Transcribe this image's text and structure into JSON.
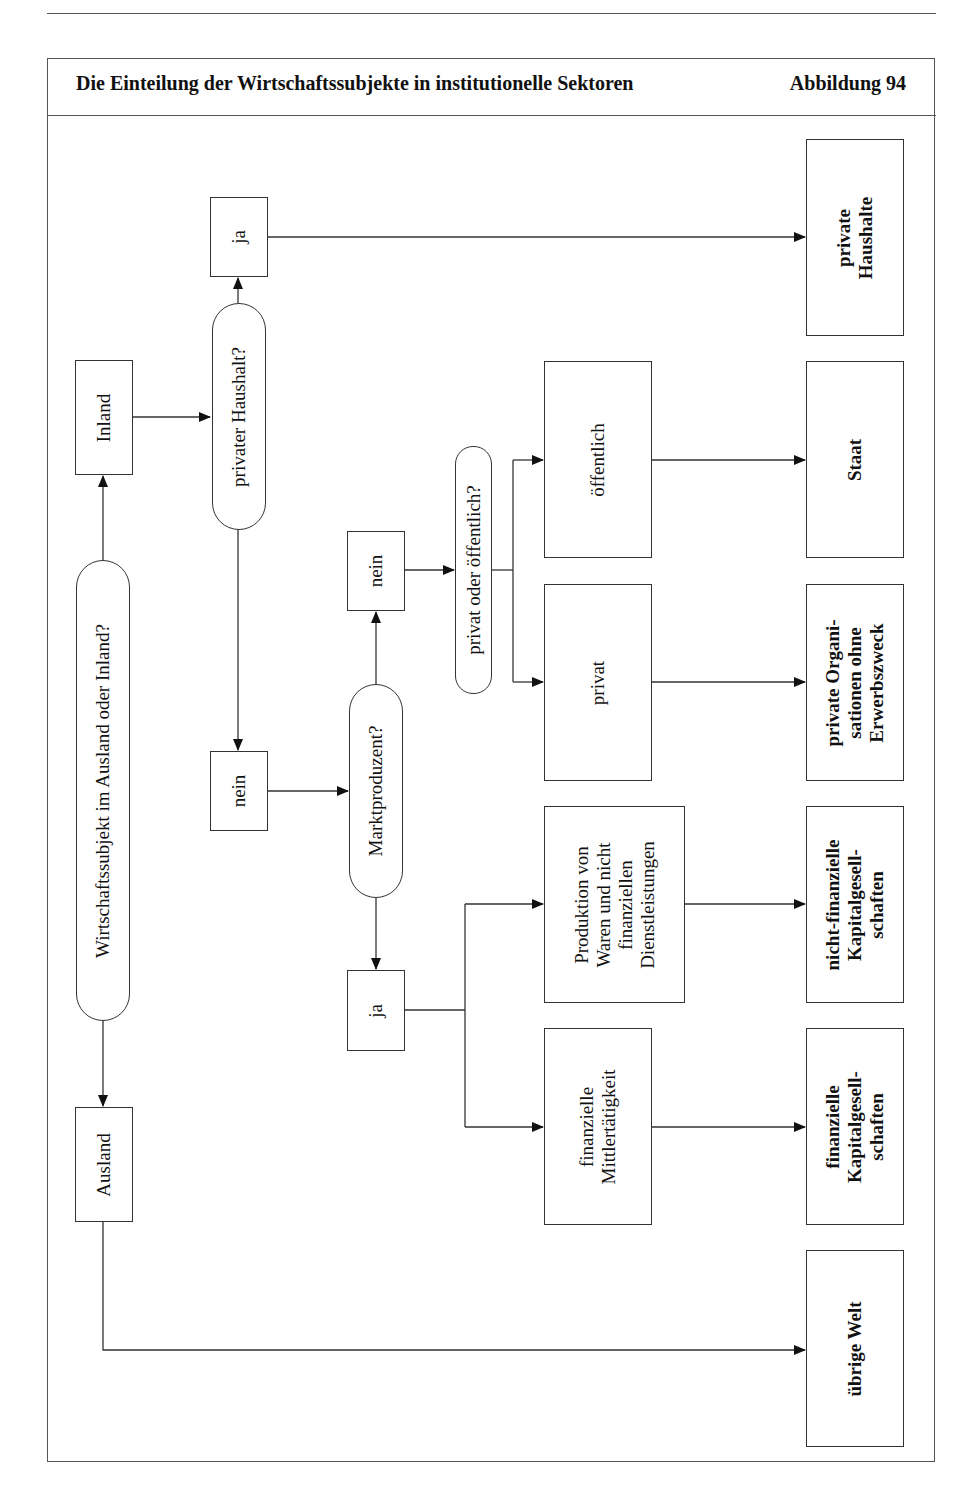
{
  "header": {
    "title": "Die Einteilung der Wirtschaftssubjekte in institutionelle Sektoren",
    "figure_label": "Abbildung 94"
  },
  "nodes": {
    "q_ausland_inland": "Wirtschaftssubjekt im Ausland oder Inland?",
    "inland": "Inland",
    "ausland": "Ausland",
    "q_privater_haushalt": "privater Haushalt?",
    "ja_haushalt": "ja",
    "nein_haushalt": "nein",
    "q_marktproduzent": "Marktproduzent?",
    "nein_markt": "nein",
    "ja_markt": "ja",
    "q_privat_oeffentlich": "privat oder öffentlich?",
    "oeffentlich": "öffentlich",
    "privat": "privat",
    "produktion": "Produktion von\nWaren und nicht\nfinanziellen\nDienstleistungen",
    "finanz_mittler": "finanzielle\nMittlertätigkeit"
  },
  "sectors": {
    "private_haushalte": "private\nHaushalte",
    "staat": "Staat",
    "private_org": "private Organi-\nsationen ohne\nErwerbszweck",
    "nicht_finanzielle": "nicht-finanzielle\nKapitalgesell-\nschaften",
    "finanzielle": "finanzielle\nKapitalgesell-\nschaften",
    "uebrige_welt": "übrige Welt"
  }
}
